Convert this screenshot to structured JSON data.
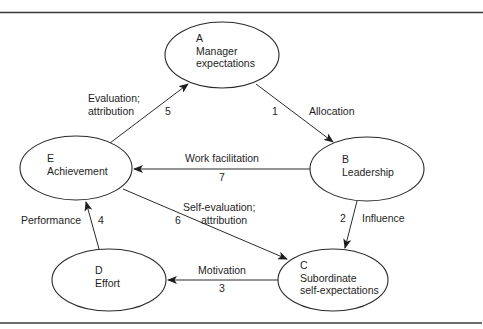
{
  "nodes": [
    {
      "id": "A",
      "letter": "A",
      "lines": [
        "Manager",
        "expectations"
      ],
      "cx": 222,
      "cy": 55,
      "rx": 57,
      "ry": 33,
      "tx": 196,
      "ty": 42
    },
    {
      "id": "B",
      "letter": "B",
      "lines": [
        "Leadership"
      ],
      "cx": 367,
      "cy": 169,
      "rx": 57,
      "ry": 32,
      "tx": 342,
      "ty": 163
    },
    {
      "id": "C",
      "letter": "C",
      "lines": [
        "Subordinate",
        "self-expectations"
      ],
      "cx": 333,
      "cy": 280,
      "rx": 55,
      "ry": 31,
      "tx": 300,
      "ty": 269
    },
    {
      "id": "D",
      "letter": "D",
      "lines": [
        "Effort"
      ],
      "cx": 109,
      "cy": 280,
      "rx": 57,
      "ry": 31,
      "tx": 95,
      "ty": 274
    },
    {
      "id": "E",
      "letter": "E",
      "lines": [
        "Achievement"
      ],
      "cx": 76,
      "cy": 168,
      "rx": 56,
      "ry": 32,
      "tx": 47,
      "ty": 162
    }
  ],
  "edges": [
    {
      "num": "1",
      "label": [
        "Allocation"
      ],
      "from": "A",
      "to": "B",
      "x1": 256,
      "y1": 84,
      "x2": 333,
      "y2": 142,
      "numx": 275,
      "numy": 115,
      "labx": 309,
      "laby": 115,
      "anchor": "start"
    },
    {
      "num": "2",
      "label": [
        "Influence"
      ],
      "from": "B",
      "to": "C",
      "x1": 357,
      "y1": 201,
      "x2": 345,
      "y2": 248,
      "numx": 343,
      "numy": 222,
      "labx": 362,
      "laby": 222,
      "anchor": "start"
    },
    {
      "num": "3",
      "label": [
        "Motivation"
      ],
      "from": "C",
      "to": "D",
      "x1": 279,
      "y1": 280,
      "x2": 168,
      "y2": 280,
      "numx": 222,
      "numy": 292,
      "labx": 222,
      "laby": 274,
      "anchor": "middle"
    },
    {
      "num": "4",
      "label": [
        "Performance"
      ],
      "from": "D",
      "to": "E",
      "x1": 99,
      "y1": 249,
      "x2": 86,
      "y2": 202,
      "numx": 101,
      "numy": 224,
      "labx": 21,
      "laby": 224,
      "anchor": "start"
    },
    {
      "num": "5",
      "label": [
        "Evaluation;",
        "attribution"
      ],
      "from": "E",
      "to": "A",
      "x1": 110,
      "y1": 143,
      "x2": 188,
      "y2": 84,
      "numx": 168,
      "numy": 115,
      "labx": 88,
      "laby": 102,
      "anchor": "start"
    },
    {
      "num": "6",
      "label": [
        "Self-evaluation;",
        "attribution"
      ],
      "from": "E",
      "to": "C",
      "x1": 123,
      "y1": 189,
      "x2": 287,
      "y2": 259,
      "numx": 178,
      "numy": 224,
      "labx": 183,
      "laby": 211,
      "anchor": "start"
    },
    {
      "num": "7",
      "label": [
        "Work facilitation"
      ],
      "from": "B",
      "to": "E",
      "x1": 310,
      "y1": 169,
      "x2": 134,
      "y2": 169,
      "numx": 222,
      "numy": 181,
      "labx": 222,
      "laby": 162,
      "anchor": "middle"
    }
  ]
}
